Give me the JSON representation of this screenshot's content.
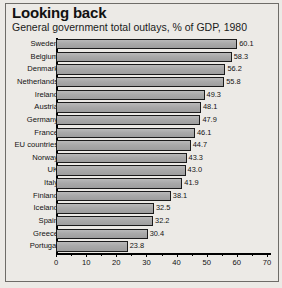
{
  "chart_data": {
    "type": "bar",
    "orientation": "horizontal",
    "title": "Looking back",
    "subtitle": "General government total outlays, % of GDP, 1980",
    "xlabel": "",
    "ylabel": "",
    "xlim": [
      0,
      70
    ],
    "xticks": [
      0,
      10,
      20,
      30,
      40,
      50,
      60,
      70
    ],
    "xtick_labels": [
      "0",
      "10",
      "20",
      "30",
      "40",
      "50",
      "60",
      "70"
    ],
    "minor_tick_step": 5,
    "grid": false,
    "legend": false,
    "bar_fill_color": "#a9a9a9",
    "bar_edge_color": "#1b1b1b",
    "background_color": "#eceae6",
    "categories": [
      "Sweden",
      "Belgium",
      "Denmark",
      "Netherlands",
      "Ireland",
      "Austria",
      "Germany",
      "France",
      "EU countries",
      "Norway",
      "UK",
      "Italy",
      "Finland",
      "Iceland",
      "Spain",
      "Greece",
      "Portugal"
    ],
    "values": [
      60.1,
      58.3,
      56.2,
      55.8,
      49.3,
      48.1,
      47.9,
      46.1,
      44.7,
      43.3,
      43.0,
      41.9,
      38.1,
      32.5,
      32.2,
      30.4,
      23.8
    ],
    "value_labels": [
      "60.1",
      "58.3",
      "56.2",
      "55.8",
      "49.3",
      "48.1",
      "47.9",
      "46.1",
      "44.7",
      "43.3",
      "43.0",
      "41.9",
      "38.1",
      "32.5",
      "32.2",
      "30.4",
      "23.8"
    ]
  }
}
